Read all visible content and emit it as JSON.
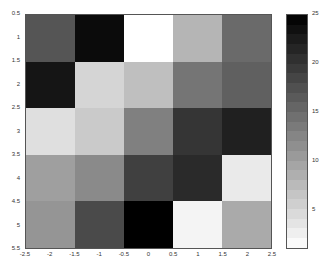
{
  "chart_data": {
    "type": "heatmap",
    "title": "",
    "xlabel": "",
    "ylabel": "",
    "matrix": [
      [
        17,
        24,
        1,
        8,
        15
      ],
      [
        23,
        5,
        7,
        14,
        16
      ],
      [
        4,
        6,
        13,
        20,
        22
      ],
      [
        10,
        12,
        19,
        21,
        3
      ],
      [
        11,
        18,
        25,
        2,
        9
      ]
    ],
    "x_ticks": [
      "-2.5",
      "-2",
      "-1.5",
      "-1",
      "-0.5",
      "0",
      "0.5",
      "1",
      "1.5",
      "2",
      "2.5"
    ],
    "y_ticks": [
      "0.5",
      "1",
      "1.5",
      "2",
      "2.5",
      "3",
      "3.5",
      "4",
      "4.5",
      "5",
      "5.5"
    ],
    "xlim": [
      -2.5,
      2.5
    ],
    "ylim": [
      0.5,
      5.5
    ],
    "colormap": "inverted-gray",
    "clim": [
      1,
      25
    ],
    "colorbar": {
      "ticks": [
        "5",
        "10",
        "15",
        "20",
        "25"
      ],
      "tick_values": [
        5,
        10,
        15,
        20,
        25
      ]
    },
    "grid": false,
    "legend": null
  }
}
